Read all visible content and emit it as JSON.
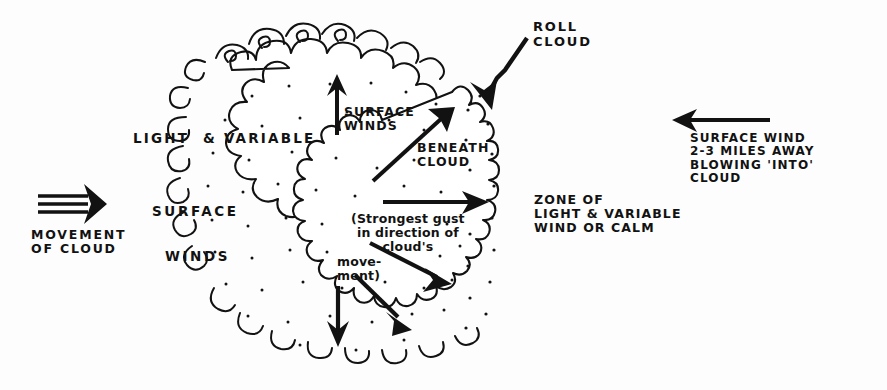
{
  "diagram": {
    "background_color": "#fdfdfd",
    "ink_color": "#121212"
  },
  "labels": {
    "light_and_variable": "LIGHT  & VARIABLE",
    "surface_left": "SURFACE",
    "winds_left": "WINDS",
    "movement_of_cloud": "MOVEMENT\nOF CLOUD",
    "surface_winds": "SURFACE\nWINDS",
    "beneath_cloud": "BENEATH\nCLOUD",
    "roll_cloud": "ROLL\nCLOUD",
    "zone_of_light": "ZONE OF\nLIGHT & VARIABLE\nWIND OR CALM",
    "surface_wind_far": "SURFACE WIND\n2-3 MILES AWAY\nBLOWING 'INTO'\nCLOUD",
    "strongest_gust": "(Strongest gust\nin direction of\ncloud's",
    "movement_close": "move-\nment)"
  },
  "features": {
    "cloud": "cumulonimbus-outline",
    "roll_cloud_band": "scalloped-vertical-band",
    "stipple": "interior-dots"
  },
  "arrows": [
    {
      "name": "movement-of-cloud-arrow",
      "direction": "right",
      "style": "triple-line"
    },
    {
      "name": "surface-winds-up-arrow",
      "direction": "up",
      "style": "solid"
    },
    {
      "name": "beneath-cloud-arrow",
      "direction": "up-right",
      "style": "solid"
    },
    {
      "name": "strongest-gust-arrow",
      "direction": "right",
      "style": "solid"
    },
    {
      "name": "gust-down-right-arrow",
      "direction": "down-right",
      "style": "solid"
    },
    {
      "name": "downdraft-arrow",
      "direction": "down",
      "style": "solid"
    },
    {
      "name": "downdraft-diagonal-arrow",
      "direction": "down-right",
      "style": "solid"
    },
    {
      "name": "roll-cloud-pointer-arrow",
      "direction": "down-left",
      "style": "kinked"
    },
    {
      "name": "surface-wind-inflow-arrow",
      "direction": "left",
      "style": "solid"
    }
  ]
}
